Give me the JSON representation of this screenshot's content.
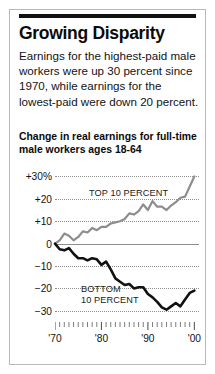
{
  "headline": "Growing Disparity",
  "deck": "Earnings for the highest-paid male workers were up 30 percent since 1970, while earnings for the lowest-paid were down 20 percent.",
  "colors": {
    "rule": "#121212",
    "top_series": "#8d8d8d",
    "bottom_series": "#111111",
    "grid": "#8e8e8e",
    "frame": "#b9b9b9"
  },
  "chart_data": {
    "type": "line",
    "title": "Change in real earnings for full-time male workers ages 18-64",
    "xlabel": "",
    "ylabel": "",
    "xlim": [
      1970,
      2001
    ],
    "ylim": [
      -35,
      32
    ],
    "grid": true,
    "gridlines": [
      30,
      20,
      10,
      0,
      -10,
      -20,
      -30
    ],
    "ytick_labels": [
      "+30%",
      "+20",
      "+10",
      "0",
      "−10",
      "−20",
      "−30"
    ],
    "ytick_values": [
      30,
      20,
      10,
      0,
      -10,
      -20,
      -30
    ],
    "xtick_labels": [
      "'70",
      "'80",
      "'90",
      "'00"
    ],
    "xtick_values": [
      1970,
      1980,
      1990,
      2000
    ],
    "xticks_minor_interval": 1,
    "legend": "inline-annotations",
    "annotations": [
      {
        "text": "TOP 10 PERCENT",
        "series": "top_10_percent",
        "x": 1977,
        "y": 22
      },
      {
        "text": "BOTTOM 10 PERCENT",
        "series": "bottom_10_percent",
        "x": 1976,
        "y": -24
      }
    ],
    "x": [
      1970,
      1971,
      1972,
      1973,
      1974,
      1975,
      1976,
      1977,
      1978,
      1979,
      1980,
      1981,
      1982,
      1983,
      1984,
      1985,
      1986,
      1987,
      1988,
      1989,
      1990,
      1991,
      1992,
      1993,
      1994,
      1995,
      1996,
      1997,
      1998,
      1999,
      2000
    ],
    "series": [
      {
        "name": "TOP 10 PERCENT",
        "color": "#8d8d8d",
        "values": [
          0,
          1.5,
          4.5,
          3.5,
          1.5,
          3.0,
          5.5,
          5.0,
          7.0,
          6.0,
          7.5,
          7.5,
          9.0,
          9.5,
          10.0,
          11.0,
          13.5,
          13.0,
          14.5,
          17.5,
          15.0,
          19.0,
          16.5,
          16.5,
          15.0,
          17.0,
          18.5,
          20.5,
          21.0,
          25.5,
          30.0
        ]
      },
      {
        "name": "BOTTOM 10 PERCENT",
        "color": "#111111",
        "values": [
          0,
          -2.5,
          -3.0,
          -2.0,
          -4.5,
          -6.5,
          -6.5,
          -7.5,
          -6.5,
          -7.0,
          -9.5,
          -8.0,
          -11.5,
          -15.5,
          -17.0,
          -18.5,
          -18.0,
          -20.0,
          -19.5,
          -19.5,
          -22.5,
          -24.0,
          -26.0,
          -28.5,
          -29.5,
          -28.0,
          -26.5,
          -28.0,
          -25.0,
          -22.0,
          -21.0
        ]
      }
    ]
  }
}
